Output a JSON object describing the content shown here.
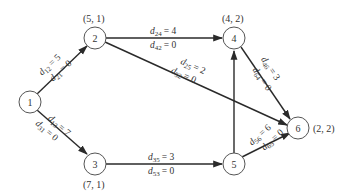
{
  "diagram": {
    "type": "directed-network",
    "nodes": [
      {
        "id": "1",
        "label": "1",
        "coord": ""
      },
      {
        "id": "2",
        "label": "2",
        "coord": "(5, 1)"
      },
      {
        "id": "3",
        "label": "3",
        "coord": "(7, 1)"
      },
      {
        "id": "4",
        "label": "4",
        "coord": "(4, 2)"
      },
      {
        "id": "5",
        "label": "5",
        "coord": ""
      },
      {
        "id": "6",
        "label": "6",
        "coord": "(2, 2)"
      }
    ],
    "edges": [
      {
        "from": "1",
        "to": "2",
        "forward": {
          "var": "d",
          "sub": "12",
          "value": "= 5"
        },
        "reverse": {
          "var": "d",
          "sub": "21",
          "value": "= 0"
        }
      },
      {
        "from": "1",
        "to": "3",
        "forward": {
          "var": "d",
          "sub": "13",
          "value": "= 7"
        },
        "reverse": {
          "var": "d",
          "sub": "31",
          "value": "= 0"
        }
      },
      {
        "from": "2",
        "to": "4",
        "forward": {
          "var": "d",
          "sub": "24",
          "value": "= 4"
        },
        "reverse": {
          "var": "d",
          "sub": "42",
          "value": "= 0"
        }
      },
      {
        "from": "2",
        "to": "6",
        "forward": {
          "var": "d",
          "sub": "25",
          "value": "= 2"
        },
        "reverse": {
          "var": "d",
          "sub": "52",
          "value": "= 0"
        }
      },
      {
        "from": "3",
        "to": "5",
        "forward": {
          "var": "d",
          "sub": "35",
          "value": "= 3"
        },
        "reverse": {
          "var": "d",
          "sub": "53",
          "value": "= 0"
        }
      },
      {
        "from": "4",
        "to": "6",
        "forward": {
          "var": "d",
          "sub": "46",
          "value": "= 3"
        },
        "reverse": {
          "var": "d",
          "sub": "64",
          "value": "= 0"
        }
      },
      {
        "from": "5",
        "to": "4",
        "forward": null,
        "reverse": null
      },
      {
        "from": "5",
        "to": "6",
        "forward": {
          "var": "d",
          "sub": "56",
          "value": "= 6"
        },
        "reverse": {
          "var": "d",
          "sub": "65",
          "value": "= 0"
        }
      }
    ]
  }
}
